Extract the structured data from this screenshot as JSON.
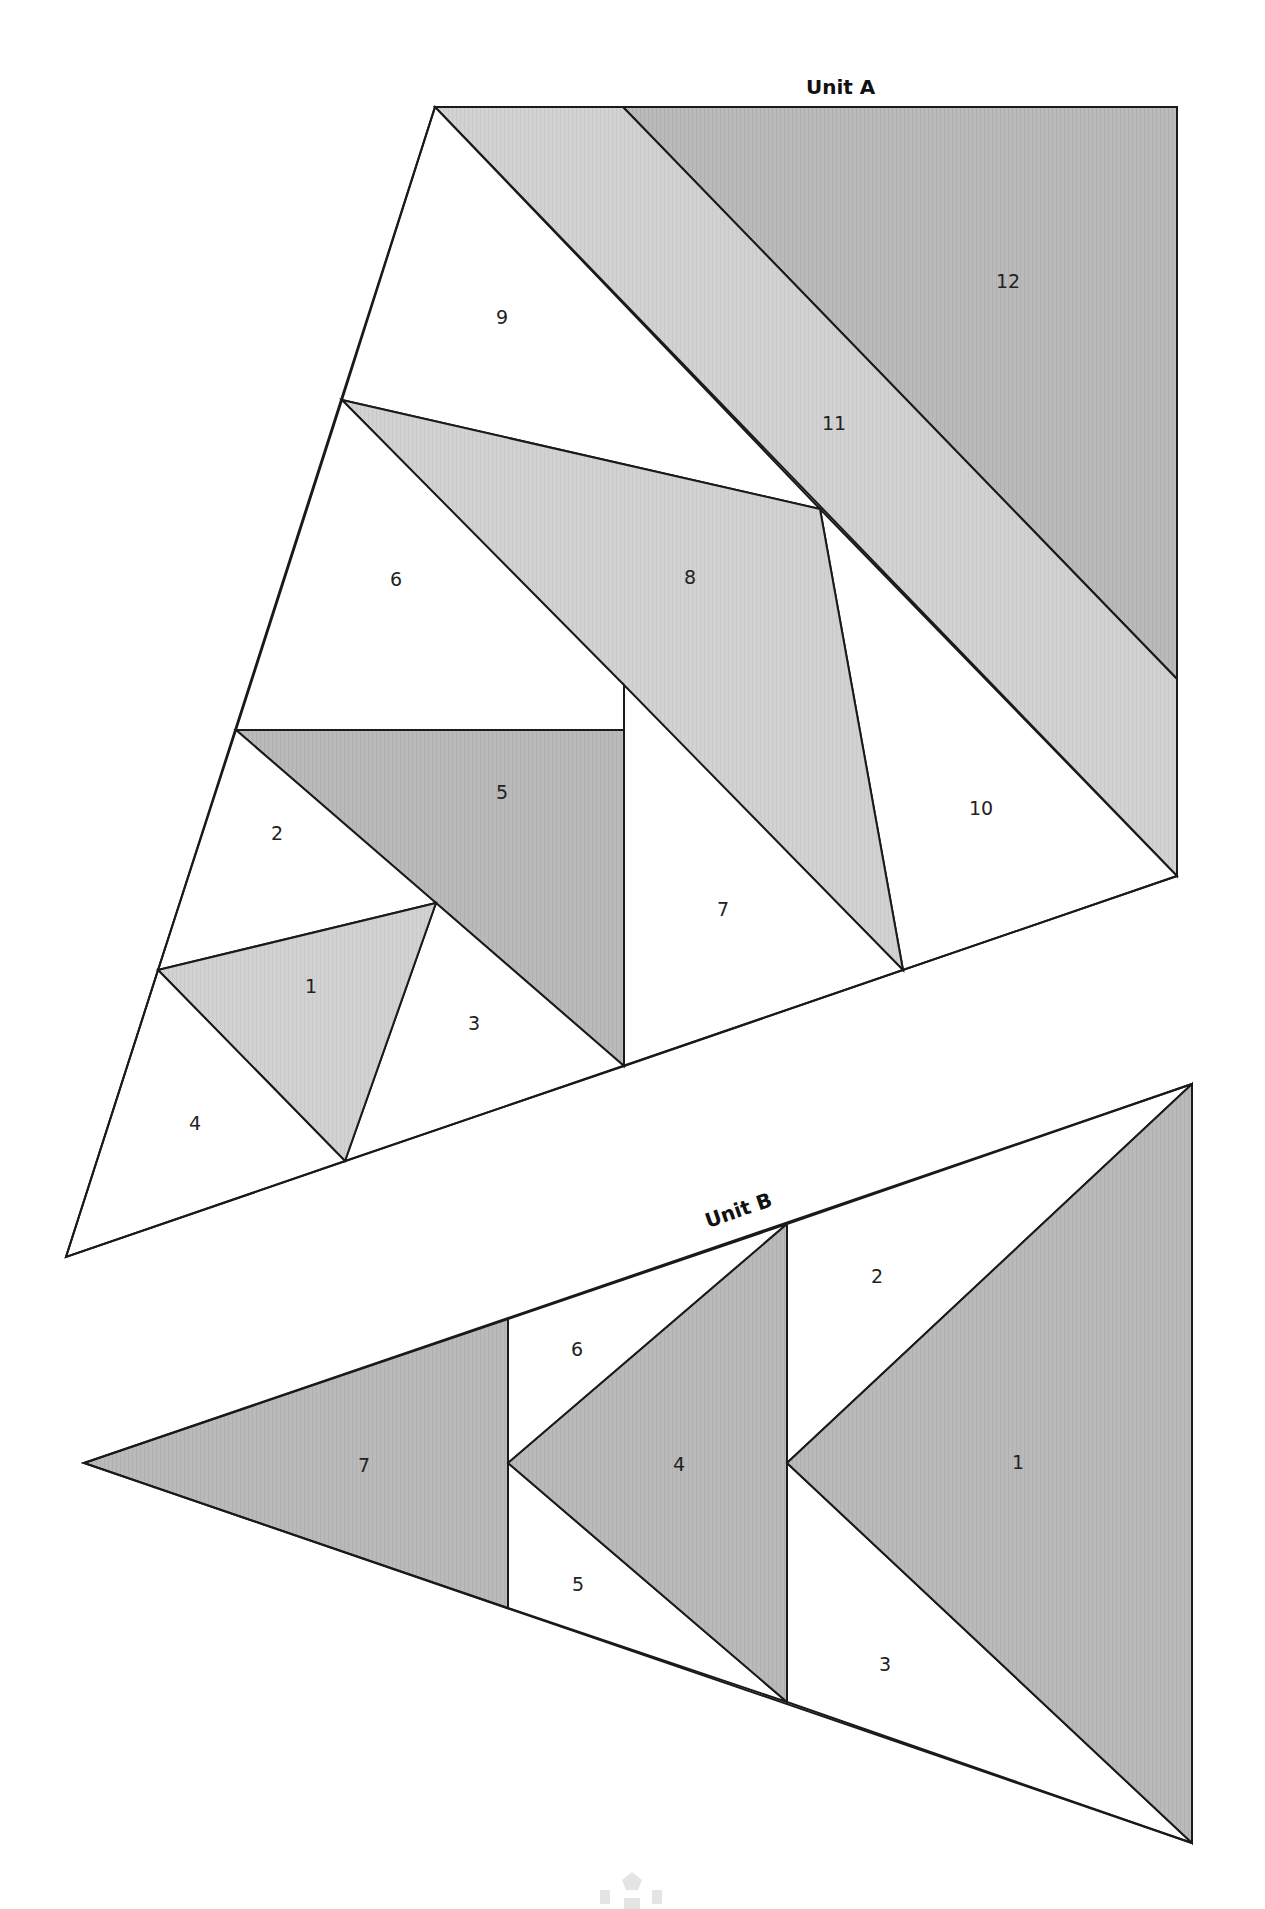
{
  "colors": {
    "white": "#ffffff",
    "light_gray": "#d3d3d3",
    "mid_gray": "#b9b9b9",
    "outline": "#1a1a1a"
  },
  "units": [
    {
      "title": "Unit A",
      "pieces": [
        {
          "id": "1",
          "label": "1",
          "fill": "light"
        },
        {
          "id": "2",
          "label": "2",
          "fill": "white"
        },
        {
          "id": "3",
          "label": "3",
          "fill": "white"
        },
        {
          "id": "4",
          "label": "4",
          "fill": "white"
        },
        {
          "id": "5",
          "label": "5",
          "fill": "mid"
        },
        {
          "id": "6",
          "label": "6",
          "fill": "white"
        },
        {
          "id": "7",
          "label": "7",
          "fill": "white"
        },
        {
          "id": "8",
          "label": "8",
          "fill": "light"
        },
        {
          "id": "9",
          "label": "9",
          "fill": "white"
        },
        {
          "id": "10",
          "label": "10",
          "fill": "white"
        },
        {
          "id": "11",
          "label": "11",
          "fill": "light"
        },
        {
          "id": "12",
          "label": "12",
          "fill": "mid"
        }
      ]
    },
    {
      "title": "Unit B",
      "pieces": [
        {
          "id": "1",
          "label": "1",
          "fill": "mid"
        },
        {
          "id": "2",
          "label": "2",
          "fill": "white"
        },
        {
          "id": "3",
          "label": "3",
          "fill": "white"
        },
        {
          "id": "4",
          "label": "4",
          "fill": "mid"
        },
        {
          "id": "5",
          "label": "5",
          "fill": "white"
        },
        {
          "id": "6",
          "label": "6",
          "fill": "white"
        },
        {
          "id": "7",
          "label": "7",
          "fill": "mid"
        }
      ]
    }
  ]
}
